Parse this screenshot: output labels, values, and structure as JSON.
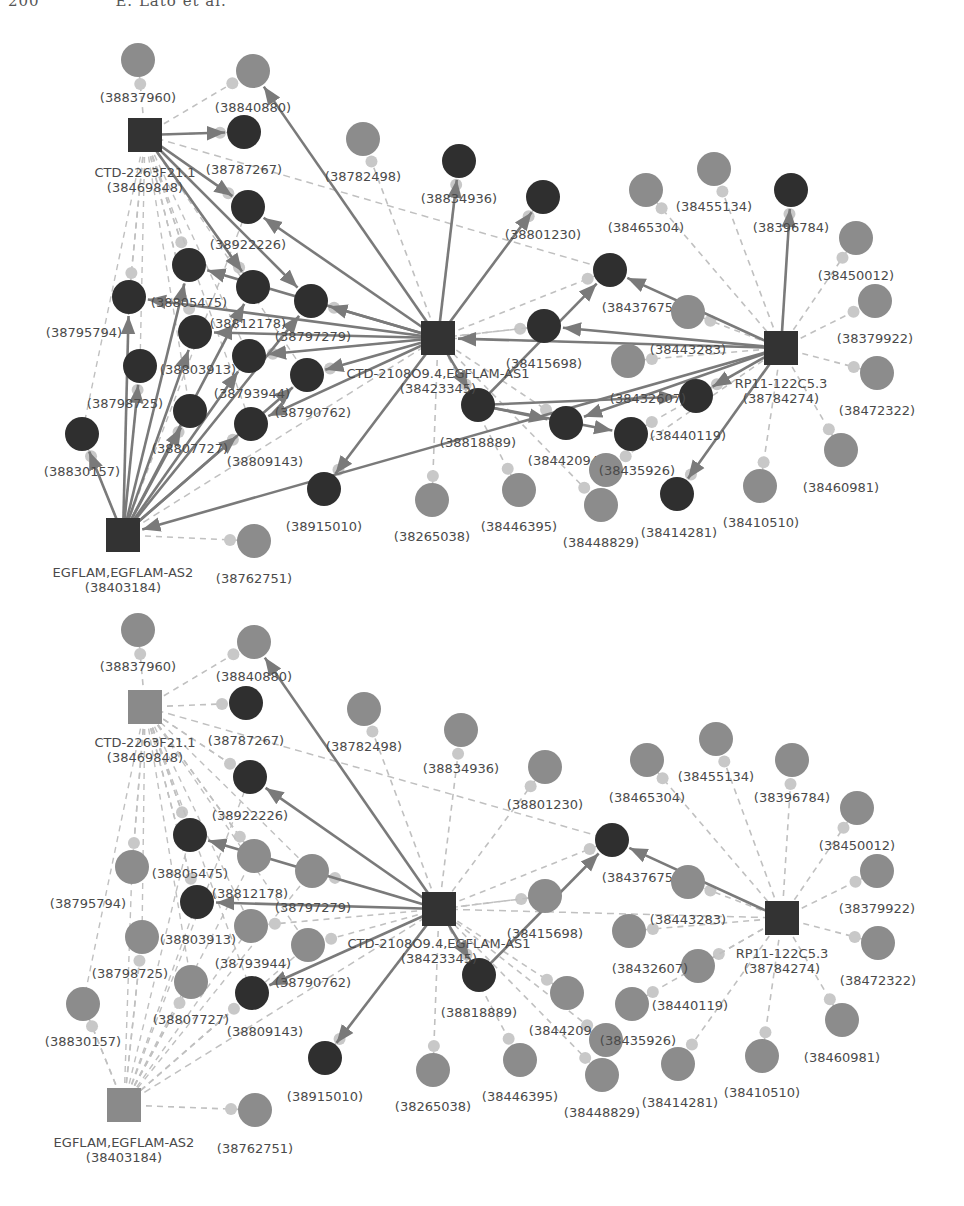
{
  "header": {
    "page_number": "200",
    "authors": "E. Lato et al."
  },
  "colors": {
    "hub_dark": "#333333",
    "hub_gray": "#8a8a8a",
    "node_dark": "#2f2f2f",
    "node_gray": "#8c8c8c",
    "edge_solid": "#7a7a7a",
    "edge_dashed": "#c0c0c0",
    "small_dot": "#c8c8c8",
    "label": "#4a4a4a"
  },
  "networks": [
    {
      "id": "top",
      "offset_y": 0,
      "hubs": [
        {
          "id": "CTD-2263F21.1",
          "name": "CTD-2263F21.1",
          "pmid": "(38469848)",
          "x": 145,
          "y": 135,
          "tone": "dark",
          "lx": 145,
          "ly": 177
        },
        {
          "id": "CTD-2108O9.4",
          "name": "CTD-2108O9.4,EGFLAM-AS1",
          "pmid": "(38423345)",
          "x": 438,
          "y": 338,
          "tone": "dark",
          "lx": 438,
          "ly": 378
        },
        {
          "id": "RP11-122C5.3",
          "name": "RP11-122C5.3",
          "pmid": "(38784274)",
          "x": 781,
          "y": 348,
          "tone": "dark",
          "lx": 781,
          "ly": 388
        },
        {
          "id": "EGFLAM",
          "name": "EGFLAM,EGFLAM-AS2",
          "pmid": "(38403184)",
          "x": 123,
          "y": 535,
          "tone": "dark",
          "lx": 123,
          "ly": 577
        }
      ],
      "nodes": [
        {
          "label": "(38837960)",
          "x": 138,
          "y": 60,
          "tone": "gray",
          "lx": 138,
          "ly": 102
        },
        {
          "label": "(38840880)",
          "x": 253,
          "y": 71,
          "tone": "gray",
          "lx": 253,
          "ly": 112
        },
        {
          "label": "(38787267)",
          "x": 244,
          "y": 132,
          "tone": "dark",
          "lx": 244,
          "ly": 174
        },
        {
          "label": "(38922226)",
          "x": 248,
          "y": 207,
          "tone": "dark",
          "lx": 248,
          "ly": 249
        },
        {
          "label": "(38805475)",
          "x": 189,
          "y": 265,
          "tone": "dark",
          "lx": 189,
          "ly": 307
        },
        {
          "label": "(38795794)",
          "x": 129,
          "y": 297,
          "tone": "dark",
          "lx": 84,
          "ly": 337
        },
        {
          "label": "(38812178)",
          "x": 253,
          "y": 287,
          "tone": "dark",
          "lx": 248,
          "ly": 328
        },
        {
          "label": "(38797279)",
          "x": 311,
          "y": 301,
          "tone": "dark",
          "lx": 313,
          "ly": 341
        },
        {
          "label": "(38803913)",
          "x": 195,
          "y": 332,
          "tone": "dark",
          "lx": 198,
          "ly": 374
        },
        {
          "label": "(38798725)",
          "x": 140,
          "y": 366,
          "tone": "dark",
          "lx": 125,
          "ly": 408
        },
        {
          "label": "(38793944)",
          "x": 249,
          "y": 356,
          "tone": "dark",
          "lx": 252,
          "ly": 398
        },
        {
          "label": "(38790762)",
          "x": 307,
          "y": 375,
          "tone": "dark",
          "lx": 313,
          "ly": 417
        },
        {
          "label": "(38807727)",
          "x": 190,
          "y": 411,
          "tone": "dark",
          "lx": 190,
          "ly": 453
        },
        {
          "label": "(38809143)",
          "x": 251,
          "y": 424,
          "tone": "dark",
          "lx": 265,
          "ly": 466
        },
        {
          "label": "(38830157)",
          "x": 82,
          "y": 434,
          "tone": "dark",
          "lx": 82,
          "ly": 476
        },
        {
          "label": "(38762751)",
          "x": 254,
          "y": 541,
          "tone": "gray",
          "lx": 254,
          "ly": 583
        },
        {
          "label": "(38782498)",
          "x": 363,
          "y": 139,
          "tone": "gray",
          "lx": 363,
          "ly": 181
        },
        {
          "label": "(38834936)",
          "x": 459,
          "y": 161,
          "tone": "dark",
          "lx": 459,
          "ly": 203
        },
        {
          "label": "(38801230)",
          "x": 543,
          "y": 197,
          "tone": "dark",
          "lx": 543,
          "ly": 239
        },
        {
          "label": "(38915010)",
          "x": 324,
          "y": 489,
          "tone": "dark",
          "lx": 324,
          "ly": 531
        },
        {
          "label": "(38437675)",
          "x": 610,
          "y": 270,
          "tone": "dark",
          "lx": 640,
          "ly": 312
        },
        {
          "label": "(38415698)",
          "x": 544,
          "y": 326,
          "tone": "dark",
          "lx": 544,
          "ly": 368
        },
        {
          "label": "(38818889)",
          "x": 478,
          "y": 405,
          "tone": "dark",
          "lx": 478,
          "ly": 447
        },
        {
          "label": "(38432607)",
          "x": 696,
          "y": 396,
          "tone": "dark",
          "lx": 648,
          "ly": 403
        },
        {
          "label": "(38442094)",
          "x": 566,
          "y": 423,
          "tone": "dark",
          "lx": 566,
          "ly": 465
        },
        {
          "label": "(38440119)",
          "x": 631,
          "y": 434,
          "tone": "dark",
          "lx": 688,
          "ly": 440
        },
        {
          "label": "(38435926)",
          "x": 606,
          "y": 470,
          "tone": "gray",
          "lx": 637,
          "ly": 475
        },
        {
          "label": "(38414281)",
          "x": 677,
          "y": 494,
          "tone": "dark",
          "lx": 679,
          "ly": 537
        },
        {
          "label": "(38410510)",
          "x": 760,
          "y": 486,
          "tone": "gray",
          "lx": 761,
          "ly": 527
        },
        {
          "label": "(38460981)",
          "x": 841,
          "y": 450,
          "tone": "gray",
          "lx": 841,
          "ly": 492
        },
        {
          "label": "(38265038)",
          "x": 432,
          "y": 500,
          "tone": "gray",
          "lx": 432,
          "ly": 541
        },
        {
          "label": "(38446395)",
          "x": 519,
          "y": 490,
          "tone": "gray",
          "lx": 519,
          "ly": 531
        },
        {
          "label": "(38448829)",
          "x": 601,
          "y": 505,
          "tone": "gray",
          "lx": 601,
          "ly": 547
        },
        {
          "label": "(38443283)",
          "x": 688,
          "y": 312,
          "tone": "gray",
          "lx": 688,
          "ly": 354
        },
        {
          "label": "(38465304)",
          "x": 646,
          "y": 190,
          "tone": "gray",
          "lx": 646,
          "ly": 232
        },
        {
          "label": "(38455134)",
          "x": 714,
          "y": 169,
          "tone": "gray",
          "lx": 714,
          "ly": 211
        },
        {
          "label": "(38396784)",
          "x": 791,
          "y": 190,
          "tone": "dark",
          "lx": 791,
          "ly": 232
        },
        {
          "label": "(38450012)",
          "x": 856,
          "y": 238,
          "tone": "gray",
          "lx": 856,
          "ly": 280
        },
        {
          "label": "(38379922)",
          "x": 875,
          "y": 301,
          "tone": "gray",
          "lx": 875,
          "ly": 343
        },
        {
          "label": "(38472322)",
          "x": 877,
          "y": 373,
          "tone": "gray",
          "lx": 877,
          "ly": 415
        },
        {
          "label": "(38626071)",
          "x": 628,
          "y": 361,
          "tone": "gray",
          "lx": 0,
          "ly": 0,
          "hidden_label": true
        }
      ]
    },
    {
      "id": "bottom",
      "offset_y": 570,
      "hubs": [
        {
          "id": "CTD-2263F21.1",
          "name": "CTD-2263F21.1",
          "pmid": "(38469848)",
          "x": 145,
          "y": 137,
          "tone": "gray",
          "lx": 145,
          "ly": 177
        },
        {
          "id": "CTD-2108O9.4",
          "name": "CTD-2108O9.4,EGFLAM-AS1",
          "pmid": "(38423345)",
          "x": 439,
          "y": 339,
          "tone": "dark",
          "lx": 439,
          "ly": 378
        },
        {
          "id": "RP11-122C5.3",
          "name": "RP11-122C5.3",
          "pmid": "(38784274)",
          "x": 782,
          "y": 348,
          "tone": "dark",
          "lx": 782,
          "ly": 388
        },
        {
          "id": "EGFLAM",
          "name": "EGFLAM,EGFLAM-AS2",
          "pmid": "(38403184)",
          "x": 124,
          "y": 535,
          "tone": "gray",
          "lx": 124,
          "ly": 577
        }
      ],
      "nodes": [
        {
          "label": "(38837960)",
          "x": 138,
          "y": 60,
          "tone": "gray",
          "lx": 138,
          "ly": 101
        },
        {
          "label": "(38840880)",
          "x": 254,
          "y": 72,
          "tone": "gray",
          "lx": 254,
          "ly": 111
        },
        {
          "label": "(38787267)",
          "x": 246,
          "y": 133,
          "tone": "dark",
          "lx": 246,
          "ly": 175
        },
        {
          "label": "(38922226)",
          "x": 250,
          "y": 207,
          "tone": "dark",
          "lx": 250,
          "ly": 250
        },
        {
          "label": "(38805475)",
          "x": 190,
          "y": 265,
          "tone": "dark",
          "lx": 190,
          "ly": 308
        },
        {
          "label": "(38795794)",
          "x": 132,
          "y": 297,
          "tone": "gray",
          "lx": 88,
          "ly": 338
        },
        {
          "label": "(38812178)",
          "x": 254,
          "y": 286,
          "tone": "gray",
          "lx": 250,
          "ly": 328
        },
        {
          "label": "(38797279)",
          "x": 312,
          "y": 301,
          "tone": "gray",
          "lx": 313,
          "ly": 342
        },
        {
          "label": "(38803913)",
          "x": 197,
          "y": 332,
          "tone": "dark",
          "lx": 198,
          "ly": 374
        },
        {
          "label": "(38798725)",
          "x": 142,
          "y": 367,
          "tone": "gray",
          "lx": 130,
          "ly": 408
        },
        {
          "label": "(38793944)",
          "x": 251,
          "y": 356,
          "tone": "gray",
          "lx": 253,
          "ly": 398
        },
        {
          "label": "(38790762)",
          "x": 308,
          "y": 375,
          "tone": "gray",
          "lx": 313,
          "ly": 417
        },
        {
          "label": "(38807727)",
          "x": 191,
          "y": 412,
          "tone": "gray",
          "lx": 191,
          "ly": 454
        },
        {
          "label": "(38809143)",
          "x": 252,
          "y": 423,
          "tone": "dark",
          "lx": 265,
          "ly": 466
        },
        {
          "label": "(38830157)",
          "x": 83,
          "y": 434,
          "tone": "gray",
          "lx": 83,
          "ly": 476
        },
        {
          "label": "(38762751)",
          "x": 255,
          "y": 540,
          "tone": "gray",
          "lx": 255,
          "ly": 583
        },
        {
          "label": "(38782498)",
          "x": 364,
          "y": 139,
          "tone": "gray",
          "lx": 364,
          "ly": 181
        },
        {
          "label": "(38834936)",
          "x": 461,
          "y": 160,
          "tone": "gray",
          "lx": 461,
          "ly": 203
        },
        {
          "label": "(38801230)",
          "x": 545,
          "y": 197,
          "tone": "gray",
          "lx": 545,
          "ly": 239
        },
        {
          "label": "(38915010)",
          "x": 325,
          "y": 488,
          "tone": "dark",
          "lx": 325,
          "ly": 531
        },
        {
          "label": "(38437675)",
          "x": 612,
          "y": 270,
          "tone": "dark",
          "lx": 640,
          "ly": 312
        },
        {
          "label": "(38415698)",
          "x": 545,
          "y": 326,
          "tone": "gray",
          "lx": 545,
          "ly": 368
        },
        {
          "label": "(38818889)",
          "x": 479,
          "y": 405,
          "tone": "dark",
          "lx": 479,
          "ly": 447
        },
        {
          "label": "(38432607)",
          "x": 698,
          "y": 396,
          "tone": "gray",
          "lx": 650,
          "ly": 403
        },
        {
          "label": "(38442094)",
          "x": 567,
          "y": 423,
          "tone": "gray",
          "lx": 567,
          "ly": 465
        },
        {
          "label": "(38440119)",
          "x": 632,
          "y": 434,
          "tone": "gray",
          "lx": 690,
          "ly": 440
        },
        {
          "label": "(38435926)",
          "x": 606,
          "y": 470,
          "tone": "gray",
          "lx": 638,
          "ly": 475
        },
        {
          "label": "(38414281)",
          "x": 678,
          "y": 494,
          "tone": "gray",
          "lx": 680,
          "ly": 537
        },
        {
          "label": "(38410510)",
          "x": 762,
          "y": 486,
          "tone": "gray",
          "lx": 762,
          "ly": 527
        },
        {
          "label": "(38460981)",
          "x": 842,
          "y": 450,
          "tone": "gray",
          "lx": 842,
          "ly": 492
        },
        {
          "label": "(38265038)",
          "x": 433,
          "y": 500,
          "tone": "gray",
          "lx": 433,
          "ly": 541
        },
        {
          "label": "(38446395)",
          "x": 520,
          "y": 490,
          "tone": "gray",
          "lx": 520,
          "ly": 531
        },
        {
          "label": "(38448829)",
          "x": 602,
          "y": 505,
          "tone": "gray",
          "lx": 602,
          "ly": 547
        },
        {
          "label": "(38443283)",
          "x": 688,
          "y": 312,
          "tone": "gray",
          "lx": 688,
          "ly": 354
        },
        {
          "label": "(38465304)",
          "x": 647,
          "y": 190,
          "tone": "gray",
          "lx": 647,
          "ly": 232
        },
        {
          "label": "(38455134)",
          "x": 716,
          "y": 169,
          "tone": "gray",
          "lx": 716,
          "ly": 211
        },
        {
          "label": "(38396784)",
          "x": 792,
          "y": 190,
          "tone": "gray",
          "lx": 792,
          "ly": 232
        },
        {
          "label": "(38450012)",
          "x": 857,
          "y": 238,
          "tone": "gray",
          "lx": 857,
          "ly": 280
        },
        {
          "label": "(38379922)",
          "x": 877,
          "y": 301,
          "tone": "gray",
          "lx": 877,
          "ly": 343
        },
        {
          "label": "(38472322)",
          "x": 878,
          "y": 373,
          "tone": "gray",
          "lx": 878,
          "ly": 415
        },
        {
          "label": "(38626071)",
          "x": 629,
          "y": 361,
          "tone": "gray",
          "lx": 0,
          "ly": 0,
          "hidden_label": true
        }
      ]
    }
  ],
  "edges_top_solid": [
    [
      "CTD-2263F21.1",
      "(38787267)"
    ],
    [
      "CTD-2263F21.1",
      "(38922226)"
    ],
    [
      "CTD-2263F21.1",
      "(38797279)"
    ],
    [
      "CTD-2263F21.1",
      "(38812178)"
    ],
    [
      "CTD-2108O9.4",
      "(38840880)"
    ],
    [
      "CTD-2108O9.4",
      "(38922226)"
    ],
    [
      "CTD-2108O9.4",
      "(38834936)"
    ],
    [
      "CTD-2108O9.4",
      "(38801230)"
    ],
    [
      "CTD-2108O9.4",
      "(38805475)"
    ],
    [
      "CTD-2108O9.4",
      "(38797279)"
    ],
    [
      "CTD-2108O9.4",
      "(38795794)"
    ],
    [
      "CTD-2108O9.4",
      "(38803913)"
    ],
    [
      "CTD-2108O9.4",
      "(38790762)"
    ],
    [
      "CTD-2108O9.4",
      "(38793944)"
    ],
    [
      "CTD-2108O9.4",
      "(38915010)"
    ],
    [
      "CTD-2108O9.4",
      "(38818889)"
    ],
    [
      "CTD-2108O9.4",
      "(38809143)"
    ],
    [
      "EGFLAM",
      "(38830157)"
    ],
    [
      "EGFLAM",
      "(38795794)"
    ],
    [
      "EGFLAM",
      "(38798725)"
    ],
    [
      "EGFLAM",
      "(38805475)"
    ],
    [
      "EGFLAM",
      "(38803913)"
    ],
    [
      "EGFLAM",
      "(38812178)"
    ],
    [
      "EGFLAM",
      "(38807727)"
    ],
    [
      "EGFLAM",
      "(38793944)"
    ],
    [
      "EGFLAM",
      "(38809143)"
    ],
    [
      "EGFLAM",
      "(38790762)"
    ],
    [
      "EGFLAM",
      "(38797279)"
    ],
    [
      "RP11-122C5.3",
      "EGFLAM"
    ],
    [
      "RP11-122C5.3",
      "(38396784)"
    ],
    [
      "RP11-122C5.3",
      "(38437675)"
    ],
    [
      "RP11-122C5.3",
      "(38415698)"
    ],
    [
      "RP11-122C5.3",
      "(38432607)"
    ],
    [
      "RP11-122C5.3",
      "(38414281)"
    ],
    [
      "RP11-122C5.3",
      "(38442094)"
    ],
    [
      "RP11-122C5.3",
      "CTD-2108O9.4"
    ],
    [
      "(38818889)",
      "(38437675)"
    ],
    [
      "(38818889)",
      "(38432607)"
    ],
    [
      "(38818889)",
      "(38440119)"
    ],
    [
      "(38818889)",
      "(38442094)"
    ]
  ],
  "edges_bottom_solid": [
    [
      "CTD-2108O9.4",
      "(38840880)"
    ],
    [
      "CTD-2108O9.4",
      "(38922226)"
    ],
    [
      "CTD-2108O9.4",
      "(38805475)"
    ],
    [
      "CTD-2108O9.4",
      "(38803913)"
    ],
    [
      "CTD-2108O9.4",
      "(38809143)"
    ],
    [
      "CTD-2108O9.4",
      "(38915010)"
    ],
    [
      "CTD-2108O9.4",
      "(38818889)"
    ],
    [
      "RP11-122C5.3",
      "(38437675)"
    ],
    [
      "(38818889)",
      "(38437675)"
    ]
  ]
}
